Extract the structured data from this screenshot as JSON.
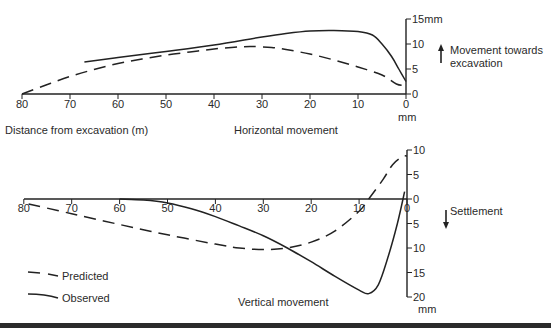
{
  "chart_data": [
    {
      "type": "line",
      "title": "Horizontal movement",
      "xlabel": "Distance from excavation (m)",
      "ylabel": "Movement towards excavation",
      "y_unit": "mm",
      "xlim": [
        80,
        0
      ],
      "ylim": [
        0,
        15
      ],
      "x_ticks": [
        80,
        70,
        60,
        50,
        40,
        30,
        20,
        10,
        0
      ],
      "y_ticks": [
        0,
        5,
        10,
        15
      ],
      "y_tick_labels": [
        "0",
        "5",
        "10",
        "15mm"
      ],
      "direction_annotation": "Movement towards excavation",
      "series": [
        {
          "name": "Predicted",
          "style": "dashed",
          "x": [
            80,
            75,
            70,
            65,
            60,
            55,
            50,
            45,
            40,
            35,
            32,
            28,
            25,
            20,
            15,
            10,
            5,
            2,
            0
          ],
          "y": [
            0,
            1.8,
            3.5,
            4.9,
            6.1,
            7.0,
            7.8,
            8.4,
            9.0,
            9.4,
            9.5,
            9.3,
            8.9,
            8.0,
            6.8,
            5.4,
            3.8,
            2.0,
            1.7
          ]
        },
        {
          "name": "Observed",
          "style": "solid",
          "x": [
            67,
            60,
            50,
            40,
            30,
            25,
            20,
            15,
            10,
            7,
            5,
            3,
            1.5,
            0
          ],
          "y": [
            6.4,
            7.3,
            8.5,
            9.8,
            11.4,
            12.1,
            12.6,
            12.7,
            12.5,
            11.8,
            10.0,
            7.5,
            5.0,
            2.5
          ]
        }
      ]
    },
    {
      "type": "line",
      "title": "Vertical movement",
      "xlabel": "",
      "ylabel": "Settlement",
      "y_unit": "mm",
      "xlim": [
        80,
        0
      ],
      "ylim": [
        -20,
        10
      ],
      "x_ticks": [
        80,
        70,
        60,
        50,
        40,
        30,
        20,
        10,
        0
      ],
      "y_ticks": [
        10,
        5,
        0,
        -5,
        -10,
        -15,
        -20
      ],
      "y_tick_labels": [
        "10",
        "5",
        "0",
        "5",
        "10",
        "15",
        "20"
      ],
      "direction_annotation": "Settlement",
      "series": [
        {
          "name": "Predicted",
          "style": "dashed",
          "x": [
            79,
            70,
            60,
            50,
            40,
            35,
            30,
            25,
            20,
            15,
            10,
            8,
            5,
            3,
            1,
            0
          ],
          "y": [
            -1.0,
            -3.0,
            -5.2,
            -7.3,
            -9.2,
            -10.0,
            -10.3,
            -10.0,
            -8.8,
            -6.5,
            -2.5,
            0,
            4.0,
            7.0,
            8.6,
            8.8
          ]
        },
        {
          "name": "Observed",
          "style": "solid",
          "x": [
            60,
            55,
            50,
            45,
            40,
            35,
            30,
            25,
            20,
            15,
            10,
            8,
            6,
            4,
            2,
            0.5
          ],
          "y": [
            0,
            -0.2,
            -0.8,
            -2.0,
            -3.6,
            -5.5,
            -7.5,
            -10.0,
            -12.8,
            -15.8,
            -18.6,
            -19.3,
            -17.5,
            -12.0,
            -5.0,
            1.5
          ]
        }
      ]
    }
  ],
  "legend": {
    "predicted_label": "Predicted",
    "observed_label": "Observed"
  },
  "labels": {
    "top_xlabel": "Distance from excavation (m)",
    "top_title": "Horizontal movement",
    "top_unit": "mm",
    "top_annotation_line1": "Movement towards",
    "top_annotation_line2": "excavation",
    "bottom_title": "Vertical movement",
    "bottom_unit": "mm",
    "bottom_annotation": "Settlement"
  }
}
